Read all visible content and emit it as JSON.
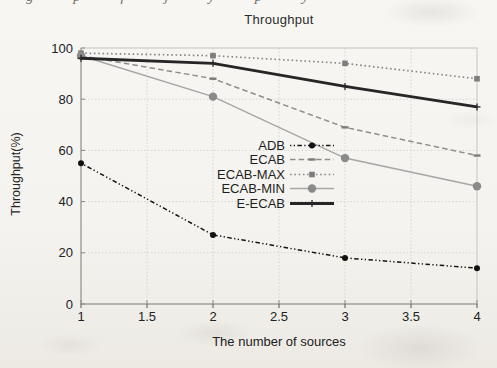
{
  "artifacts": {
    "cropped_line_fragments": "g p f j y p y"
  },
  "chart_data": {
    "type": "line",
    "title": "Throughput",
    "xlabel": "The number of sources",
    "ylabel": "Throughput(%)",
    "x": [
      1,
      2,
      3,
      4
    ],
    "xlim": [
      1,
      4
    ],
    "ylim": [
      0,
      100
    ],
    "xticks": [
      1,
      1.5,
      2,
      2.5,
      3,
      3.5,
      4
    ],
    "yticks": [
      0,
      20,
      40,
      60,
      80,
      100
    ],
    "grid": true,
    "legend_position": "inside center-right",
    "colors": {
      "grid": "#d7d4ce",
      "axis": "#94908a",
      "box": "#c8c4bd",
      "tick_text": "#222222"
    },
    "series": [
      {
        "name": "ADB",
        "values": [
          55,
          27,
          18,
          14
        ],
        "color": "#141414",
        "line": "dashdot",
        "marker": "dot",
        "marker_color": "#111111"
      },
      {
        "name": "ECAB",
        "values": [
          97,
          88,
          69,
          58
        ],
        "color": "#8e8e8e",
        "line": "dashed",
        "marker": "dash",
        "marker_color": "#7d7d7d"
      },
      {
        "name": "ECAB-MAX",
        "values": [
          98,
          97,
          94,
          88
        ],
        "color": "#878787",
        "line": "dotted",
        "marker": "square",
        "marker_color": "#7d7d7d"
      },
      {
        "name": "ECAB-MIN",
        "values": [
          97,
          81,
          57,
          46
        ],
        "color": "#a6a6a6",
        "line": "solid",
        "marker": "circle",
        "marker_color": "#8a8a8a"
      },
      {
        "name": "E-ECAB",
        "values": [
          96,
          94,
          85,
          77
        ],
        "color": "#262626",
        "line": "thick",
        "marker": "plus",
        "marker_color": "#262626"
      }
    ]
  }
}
